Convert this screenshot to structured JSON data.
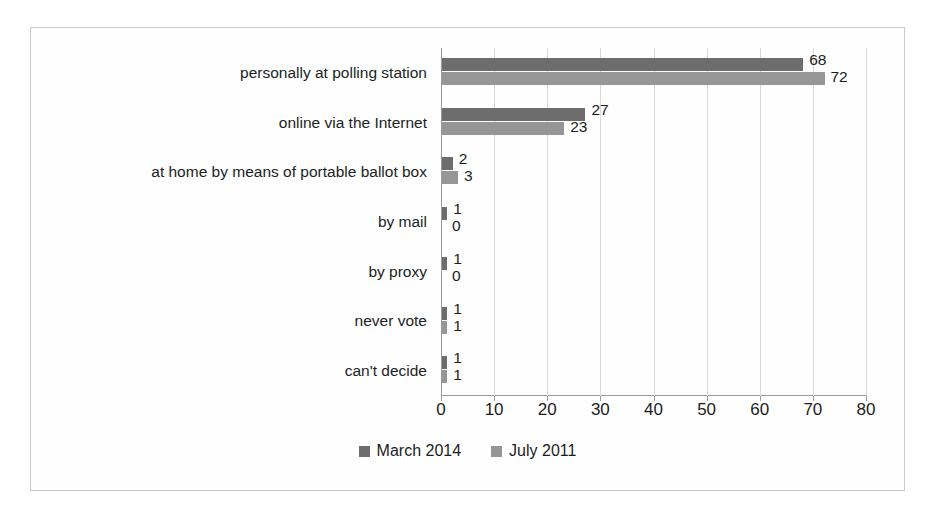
{
  "chart_data": {
    "type": "bar",
    "orientation": "horizontal",
    "title": "",
    "xlabel": "",
    "ylabel": "",
    "xlim": [
      0,
      80
    ],
    "xticks": [
      0,
      10,
      20,
      30,
      40,
      50,
      60,
      70,
      80
    ],
    "grid": true,
    "legend_position": "bottom",
    "categories": [
      "personally at polling station",
      "online via the Internet",
      "at home by means of portable ballot box",
      "by mail",
      "by proxy",
      "never vote",
      "can't decide"
    ],
    "series": [
      {
        "name": "March 2014",
        "color": "#6d6d6d",
        "values": [
          68,
          27,
          2,
          1,
          1,
          1,
          1
        ]
      },
      {
        "name": "July 2011",
        "color": "#969696",
        "values": [
          72,
          23,
          3,
          0,
          0,
          1,
          1
        ]
      }
    ]
  },
  "legend": {
    "items": [
      {
        "label": "March 2014",
        "color": "#6d6d6d"
      },
      {
        "label": "July 2011",
        "color": "#969696"
      }
    ]
  }
}
